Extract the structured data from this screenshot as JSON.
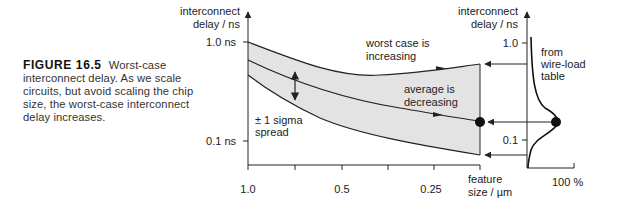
{
  "caption": {
    "figure_label": "FIGURE 16.5",
    "text": "Worst-case interconnect delay. As we scale circuits, but avoid scaling the chip size, the worst-case interconnect delay increases."
  },
  "left_axis": {
    "ylabel_line1": "interconnect",
    "ylabel_line2": "delay / ns",
    "ytick_top": "1.0 ns",
    "ytick_bottom": "0.1 ns",
    "xtick_labels": [
      "1.0",
      "0.5",
      "0.25"
    ],
    "xlabel_line1": "feature",
    "xlabel_line2": "size / µm"
  },
  "annotations": {
    "worst_case_line1": "worst case is",
    "worst_case_line2": "increasing",
    "average_line1": "average is",
    "average_line2": "decreasing",
    "sigma_line1": "± 1 sigma",
    "sigma_line2": "spread"
  },
  "right_axis": {
    "ylabel_line1": "interconnect",
    "ylabel_line2": "delay / ns",
    "ytick_top": "1.0",
    "ytick_bottom": "0.1",
    "xlabel": "100 %",
    "source_line1": "from",
    "source_line2": "wire-load",
    "source_line3": "table"
  },
  "colors": {
    "band_fill": "#e3e3e3",
    "line": "#222222"
  }
}
